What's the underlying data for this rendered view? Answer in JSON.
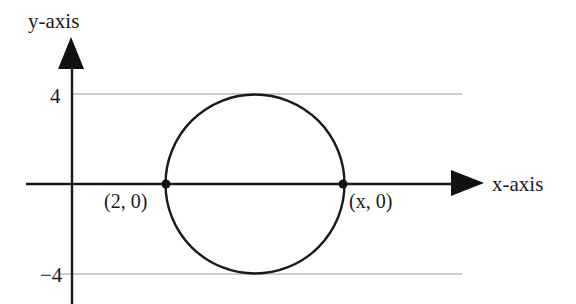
{
  "diagram": {
    "type": "coordinate-plane-circle",
    "axes": {
      "x_label": "x-axis",
      "y_label": "y-axis"
    },
    "tick_labels": {
      "upper": "4",
      "lower": "−4"
    },
    "points": [
      {
        "label": "(2, 0)",
        "x": 2,
        "y": 0
      },
      {
        "label": "(x, 0)",
        "x": "x",
        "y": 0
      }
    ],
    "circle": {
      "tangent_to": [
        "y = 4",
        "y = -4"
      ],
      "passes_through": [
        "(2, 0)",
        "(x, 0)"
      ]
    },
    "colors": {
      "ink": "#1a1a1a",
      "gridline": "#9a9a9a",
      "background": "#ffffff"
    }
  }
}
